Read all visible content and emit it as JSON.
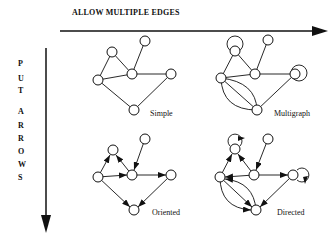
{
  "axes": {
    "horizontal": {
      "label": "ALLOW MULTIPLE EDGES"
    },
    "vertical": {
      "letters": [
        "P",
        "U",
        "T",
        "A",
        "R",
        "R",
        "O",
        "W",
        "S"
      ],
      "label": "PUT ARROWS"
    }
  },
  "graphs": [
    {
      "name": "Simple",
      "label": "Simple",
      "directed": false,
      "multi": false
    },
    {
      "name": "Multigraph",
      "label": "Multigraph",
      "directed": false,
      "multi": true
    },
    {
      "name": "Oriented",
      "label": "Oriented",
      "directed": true,
      "multi": false
    },
    {
      "name": "Directed",
      "label": "Directed",
      "directed": true,
      "multi": true
    }
  ],
  "colors": {
    "ink": "#111111",
    "background": "#ffffff"
  }
}
